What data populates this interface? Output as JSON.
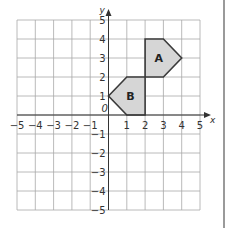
{
  "diagram": {
    "type": "coordinate-grid",
    "x_range": [
      -5,
      5
    ],
    "y_range": [
      -5,
      5
    ],
    "x_axis_label": "x",
    "y_axis_label": "y",
    "origin_label": "0",
    "x_tick_labels": [
      "−5",
      "−4",
      "−3",
      "−2",
      "−1",
      "1",
      "2",
      "3",
      "4",
      "5"
    ],
    "x_tick_values": [
      -5,
      -4,
      -3,
      -2,
      -1,
      1,
      2,
      3,
      4,
      5
    ],
    "y_tick_labels": [
      "−5",
      "−4",
      "−3",
      "−2",
      "−1",
      "1",
      "2",
      "3",
      "4",
      "5"
    ],
    "y_tick_values": [
      -5,
      -4,
      -3,
      -2,
      -1,
      1,
      2,
      3,
      4,
      5
    ],
    "colors": {
      "grid": "#a8a8a8",
      "axis": "#333333",
      "shape_fill": "#d6d6d6",
      "shape_stroke": "#3a3a3a",
      "label": "#333333"
    },
    "shapes": [
      {
        "label": "A",
        "vertices": [
          [
            2,
            4
          ],
          [
            3,
            4
          ],
          [
            4,
            3
          ],
          [
            3,
            2
          ],
          [
            2,
            2
          ]
        ],
        "label_pos": [
          2.75,
          3
        ]
      },
      {
        "label": "B",
        "vertices": [
          [
            0,
            1
          ],
          [
            1,
            2
          ],
          [
            2,
            2
          ],
          [
            2,
            0
          ],
          [
            1,
            0
          ]
        ],
        "label_pos": [
          1.2,
          1
        ]
      }
    ]
  }
}
